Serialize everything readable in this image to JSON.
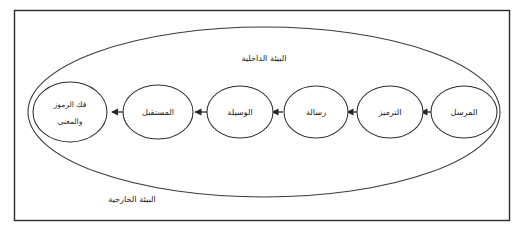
{
  "figure": {
    "background_color": "#ffffff",
    "frame_color": "#2b2b2b",
    "ellipse_color": "#2e2e2e",
    "arrow_color": "#272727",
    "text_color": "#1a1a1a"
  },
  "environments": {
    "inner_label": "البيئة الداخلية",
    "outer_label": "البيئة الخارجية"
  },
  "nodes": [
    {
      "id": "sender",
      "label": "المرسل",
      "lines": [
        "المرسل"
      ]
    },
    {
      "id": "encoding",
      "label": "الترميز",
      "lines": [
        "الترميز"
      ]
    },
    {
      "id": "message",
      "label": "رسالة",
      "lines": [
        "رسالة"
      ]
    },
    {
      "id": "medium",
      "label": "الوسيلة",
      "lines": [
        "الوسيلة"
      ]
    },
    {
      "id": "receiver",
      "label": "المستقبل",
      "lines": [
        "المستقبل"
      ]
    },
    {
      "id": "decoding",
      "label": "فك الرموز والمعنى",
      "lines": [
        "فك الرموز",
        "والمعنى"
      ]
    }
  ],
  "arrows": [
    {
      "from": "sender",
      "to": "encoding",
      "direction": "left"
    },
    {
      "from": "encoding",
      "to": "message",
      "direction": "left"
    },
    {
      "from": "message",
      "to": "medium",
      "direction": "left"
    },
    {
      "from": "medium",
      "to": "receiver",
      "direction": "left"
    },
    {
      "from": "receiver",
      "to": "decoding",
      "direction": "left"
    }
  ]
}
